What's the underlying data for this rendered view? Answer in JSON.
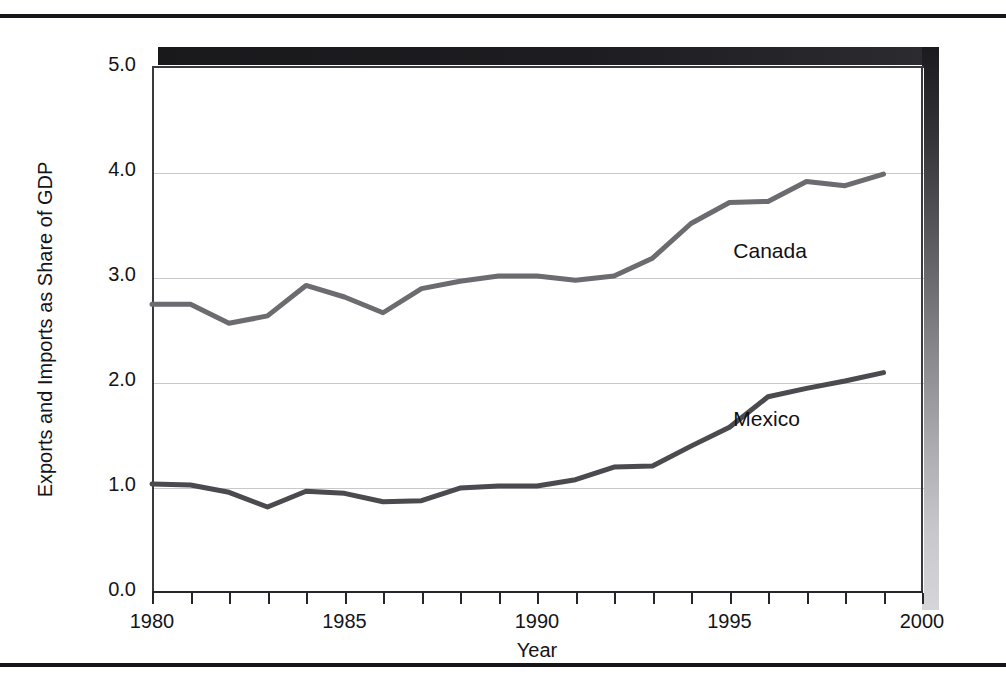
{
  "figure": {
    "axis_titles": {
      "y": "Exports and Imports as Share of GDP",
      "x": "Year"
    },
    "y_ticks": [
      "0.0",
      "1.0",
      "2.0",
      "3.0",
      "4.0",
      "5.0"
    ],
    "x_ticks": [
      "1980",
      "1985",
      "1990",
      "1995",
      "2000"
    ],
    "series_labels": {
      "canada": "Canada",
      "mexico": "Mexico"
    },
    "colors": {
      "canada_line": "#6b6b70",
      "mexico_line": "#4a4a4f",
      "gridline": "#c9c9cd",
      "axis": "#26262a",
      "text": "#141418",
      "shadow_dark": "#19191c"
    }
  },
  "chart_data": {
    "type": "line",
    "title": "",
    "xlabel": "Year",
    "ylabel": "Exports and Imports as Share of GDP",
    "xlim": [
      1980,
      2000
    ],
    "ylim": [
      0.0,
      5.0
    ],
    "ytick_values": [
      0.0,
      1.0,
      2.0,
      3.0,
      4.0,
      5.0
    ],
    "xtick_values": [
      1980,
      1985,
      1990,
      1995,
      2000
    ],
    "xtick_minor_step": 1,
    "grid": "horizontal",
    "legend_position": "inline-annotation",
    "x": [
      1980,
      1981,
      1982,
      1983,
      1984,
      1985,
      1986,
      1987,
      1988,
      1989,
      1990,
      1991,
      1992,
      1993,
      1994,
      1995,
      1996,
      1997,
      1998,
      1999
    ],
    "series": [
      {
        "name": "Canada",
        "color": "#6b6b70",
        "values": [
          2.73,
          2.73,
          2.55,
          2.62,
          2.91,
          2.8,
          2.65,
          2.88,
          2.95,
          3.0,
          3.0,
          2.96,
          3.0,
          3.17,
          3.5,
          3.7,
          3.71,
          3.9,
          3.86,
          3.97
        ],
        "annotation": {
          "text": "Canada",
          "x": 1995.1,
          "y": 3.22
        }
      },
      {
        "name": "Mexico",
        "color": "#4a4a4f",
        "values": [
          1.02,
          1.01,
          0.94,
          0.8,
          0.95,
          0.93,
          0.85,
          0.86,
          0.98,
          1.0,
          1.0,
          1.06,
          1.18,
          1.19,
          1.38,
          1.56,
          1.85,
          1.93,
          2.0,
          2.08
        ],
        "annotation": {
          "text": "Mexico",
          "x": 1995.1,
          "y": 1.62
        }
      }
    ]
  }
}
